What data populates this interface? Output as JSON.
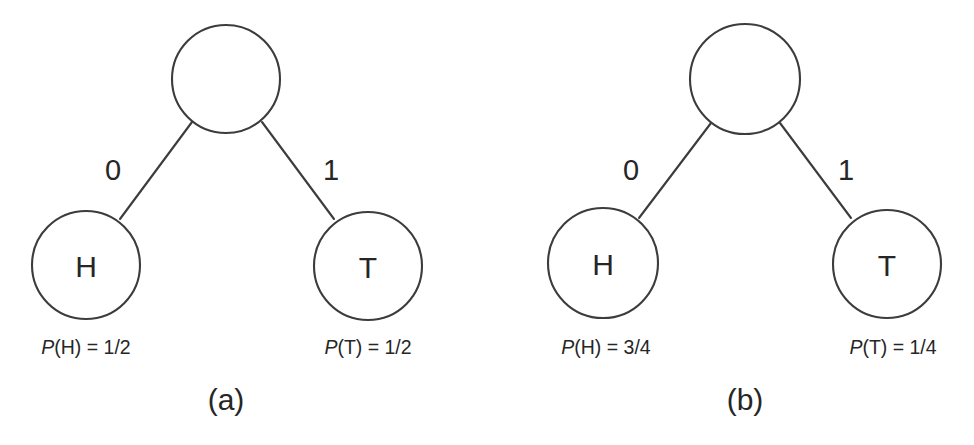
{
  "figure": {
    "background_color": "#ffffff",
    "stroke_color": "#3c3c3c",
    "text_color": "#262626",
    "panels": [
      {
        "id": "panel-a",
        "caption": "(a)",
        "root": {
          "label": "",
          "cx": 226,
          "cy": 79,
          "r": 54
        },
        "edges": [
          {
            "label": "0",
            "label_x": 113,
            "label_y": 180,
            "x1": 192,
            "y1": 122,
            "x2": 120,
            "y2": 219
          },
          {
            "label": "1",
            "label_x": 331,
            "label_y": 180,
            "x1": 262,
            "y1": 122,
            "x2": 334,
            "y2": 219
          }
        ],
        "leaves": [
          {
            "node_label": "H",
            "cx": 86,
            "cy": 265,
            "r": 54,
            "prob_var": "P",
            "prob_arg": "(H) = ",
            "prob_value": "1/2",
            "prob_text": "P(H) = 1/2",
            "prob_x": 86,
            "prob_y": 354
          },
          {
            "node_label": "T",
            "cx": 368,
            "cy": 266,
            "r": 54,
            "prob_var": "P",
            "prob_arg": "(T) = ",
            "prob_value": "1/2",
            "prob_text": "P(T) = 1/2",
            "prob_x": 368,
            "prob_y": 354
          }
        ],
        "caption_x": 226,
        "caption_y": 410
      },
      {
        "id": "panel-b",
        "caption": "(b)",
        "root": {
          "label": "",
          "cx": 745,
          "cy": 79,
          "r": 55
        },
        "edges": [
          {
            "label": "0",
            "label_x": 631,
            "label_y": 180,
            "x1": 711,
            "y1": 123,
            "x2": 639,
            "y2": 218
          },
          {
            "label": "1",
            "label_x": 846,
            "label_y": 180,
            "x1": 780,
            "y1": 123,
            "x2": 851,
            "y2": 218
          }
        ],
        "leaves": [
          {
            "node_label": "H",
            "cx": 603,
            "cy": 263,
            "r": 55,
            "prob_var": "P",
            "prob_arg": "(H) = ",
            "prob_value": "3/4",
            "prob_text": "P(H) = 3/4",
            "prob_x": 606,
            "prob_y": 354
          },
          {
            "node_label": "T",
            "cx": 887,
            "cy": 264,
            "r": 54,
            "prob_var": "P",
            "prob_arg": "(T) = ",
            "prob_value": "1/4",
            "prob_text": "P(T) = 1/4",
            "prob_x": 893,
            "prob_y": 354
          }
        ],
        "caption_x": 745,
        "caption_y": 410
      }
    ]
  }
}
